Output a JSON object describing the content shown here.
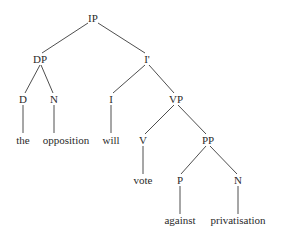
{
  "tree": {
    "nodes": {
      "ip": "IP",
      "dp": "DP",
      "ibar": "I'",
      "d": "D",
      "n1": "N",
      "i": "I",
      "vp": "VP",
      "v": "V",
      "pp": "PP",
      "p": "P",
      "n2": "N"
    },
    "words": {
      "the": "the",
      "opposition": "opposition",
      "will": "will",
      "vote": "vote",
      "against": "against",
      "privatisation": "privatisation"
    },
    "sentence": "the opposition will vote against privatisation"
  }
}
